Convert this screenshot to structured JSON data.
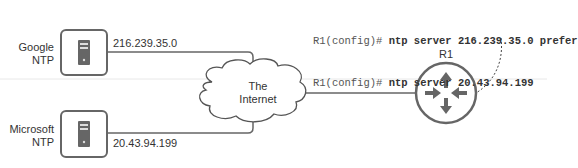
{
  "cli": {
    "lines": [
      {
        "prompt": "R1(config)#",
        "command": "ntp server 216.239.35.0 prefer"
      },
      {
        "prompt": "R1(config)#",
        "command": "ntp server 20.43.94.199"
      }
    ]
  },
  "nodes": {
    "google": {
      "name_line1": "Google",
      "name_line2": "NTP",
      "ip": "216.239.35.0"
    },
    "microsoft": {
      "name_line1": "Microsoft",
      "name_line2": "NTP",
      "ip": "20.43.94.199"
    },
    "internet": {
      "line1": "The",
      "line2": "Internet"
    },
    "router": {
      "name": "R1"
    }
  },
  "colors": {
    "line": "#666666",
    "icon": "#555555",
    "divider": "#e6e6e6"
  }
}
